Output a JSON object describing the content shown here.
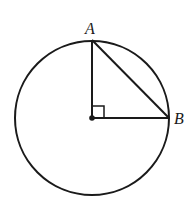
{
  "figure": {
    "type": "circle-with-right-triangle",
    "points": {
      "A": {
        "label": "A"
      },
      "B": {
        "label": "B"
      },
      "O": {
        "label": ""
      }
    },
    "right_angle_at": "center",
    "colors": {
      "stroke": "#1a1a1a",
      "background": "#ffffff"
    }
  }
}
